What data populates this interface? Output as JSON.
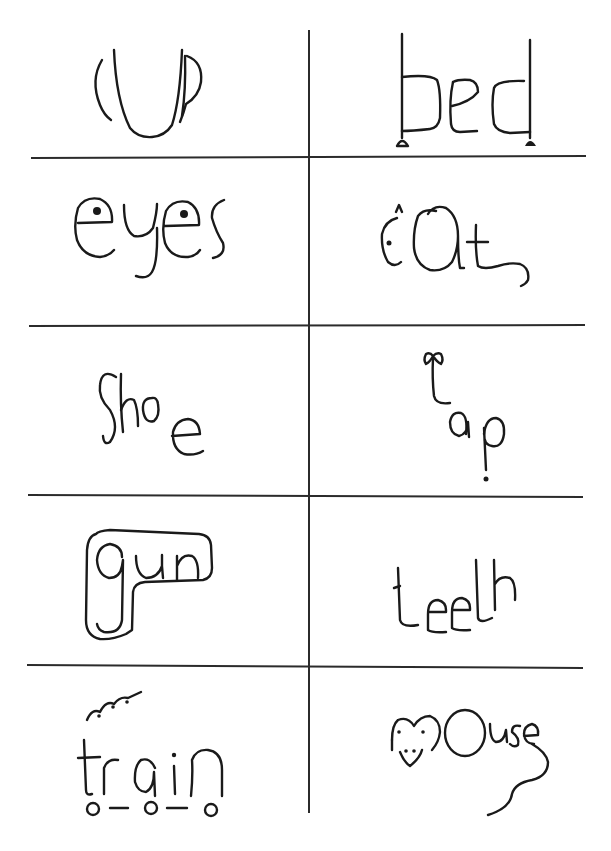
{
  "worksheet": {
    "layout": {
      "columns": 2,
      "rows": 5
    },
    "colors": {
      "ink": "#1a1a1a",
      "paper": "#ffffff",
      "rule": "#2b2b2b"
    },
    "cards": [
      {
        "row": 0,
        "col": 0,
        "word": "cup",
        "illustration": "letters shaped as a cup with a handle"
      },
      {
        "row": 0,
        "col": 1,
        "word": "bed",
        "illustration": "letters forming a bed frame with legs"
      },
      {
        "row": 1,
        "col": 0,
        "word": "eyes",
        "illustration": "two e letters with pupils as eyes"
      },
      {
        "row": 1,
        "col": 1,
        "word": "cat",
        "illustration": "c with ear and eye, a as body, t with tail"
      },
      {
        "row": 2,
        "col": 0,
        "word": "shoe",
        "illustration": "letters arranged like a shoe"
      },
      {
        "row": 2,
        "col": 1,
        "word": "tap",
        "illustration": "t with bow as tap handle, dripping p"
      },
      {
        "row": 3,
        "col": 0,
        "word": "gun",
        "illustration": "word outlined in a pistol shape"
      },
      {
        "row": 3,
        "col": 1,
        "word": "teeth",
        "illustration": "letters like a row of teeth"
      },
      {
        "row": 4,
        "col": 0,
        "word": "train",
        "illustration": "letters as carriages with smoke and wheels"
      },
      {
        "row": 4,
        "col": 1,
        "word": "mouse",
        "illustration": "m as mouse face, tail from e"
      }
    ]
  }
}
